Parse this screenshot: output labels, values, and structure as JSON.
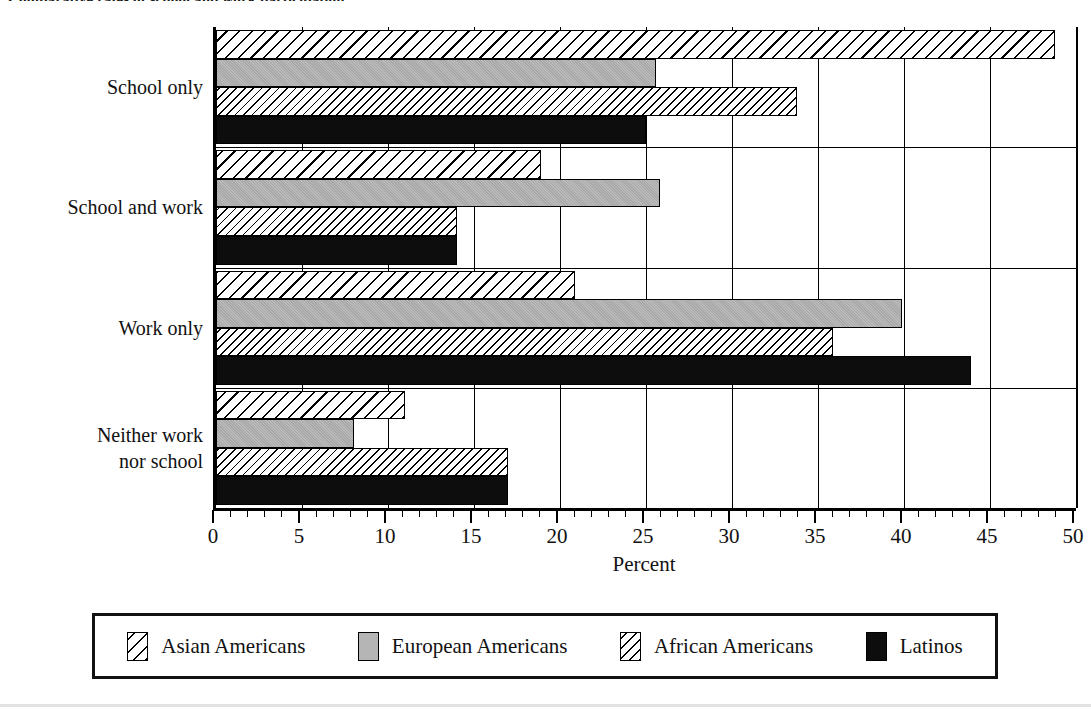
{
  "title": "Comparative rates of school and work participation",
  "axis": {
    "x_title": "Percent",
    "x_ticks": [
      0,
      5,
      10,
      15,
      20,
      25,
      30,
      35,
      40,
      45,
      50
    ],
    "x_min": 0,
    "x_max": 50,
    "x_minor_step": 1
  },
  "legend": {
    "items": [
      {
        "label": "Asian Americans",
        "key": "asian",
        "pattern": "diagonal-hatch-wide",
        "color": "#ffffff"
      },
      {
        "label": "European Americans",
        "key": "european",
        "pattern": "solid-gray",
        "color": "#b5b5b5"
      },
      {
        "label": "African Americans",
        "key": "african",
        "pattern": "diagonal-hatch-narrow",
        "color": "#ffffff"
      },
      {
        "label": "Latinos",
        "key": "latino",
        "pattern": "solid-black",
        "color": "#0d0d0d"
      }
    ]
  },
  "categories": [
    {
      "label": "School only",
      "lines": [
        "School only"
      ]
    },
    {
      "label": "School and work",
      "lines": [
        "School and work"
      ]
    },
    {
      "label": "Work only",
      "lines": [
        "Work only"
      ]
    },
    {
      "label": "Neither work nor school",
      "lines": [
        "Neither work",
        "nor school"
      ]
    }
  ],
  "chart_data": {
    "type": "bar",
    "orientation": "horizontal",
    "title": "Comparative rates of school and work participation",
    "xlabel": "Percent",
    "ylabel": "",
    "xlim": [
      0,
      50
    ],
    "grid": true,
    "grid_axis": "x",
    "legend_position": "bottom",
    "categories": [
      "School only",
      "School and work",
      "Work only",
      "Neither work nor school"
    ],
    "series": [
      {
        "name": "Asian Americans",
        "values": [
          48.8,
          18.9,
          20.9,
          11.0
        ]
      },
      {
        "name": "European Americans",
        "values": [
          25.6,
          25.8,
          39.9,
          8.0
        ]
      },
      {
        "name": "African Americans",
        "values": [
          33.8,
          14.0,
          35.9,
          17.0
        ]
      },
      {
        "name": "Latinos",
        "values": [
          25.0,
          14.0,
          43.9,
          17.0
        ]
      }
    ]
  }
}
